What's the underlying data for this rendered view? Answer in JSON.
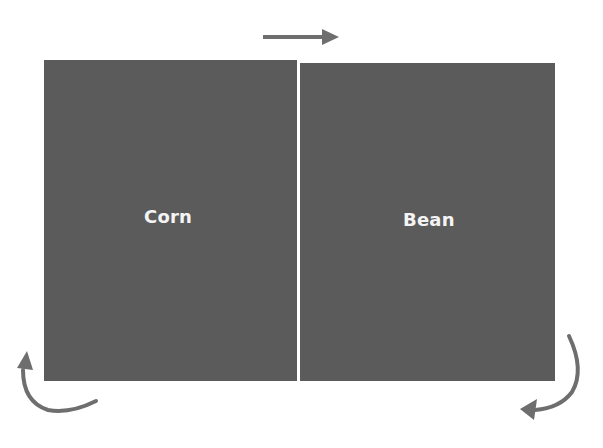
{
  "diagram": {
    "type": "crop-rotation",
    "fields": [
      {
        "id": "corn",
        "label": "Corn"
      },
      {
        "id": "bean",
        "label": "Bean"
      }
    ],
    "arrows": [
      {
        "id": "top",
        "direction": "right",
        "shape": "straight"
      },
      {
        "id": "bottom-right",
        "direction": "down-then-left",
        "shape": "curved"
      },
      {
        "id": "bottom-left",
        "direction": "left-then-up",
        "shape": "curved"
      }
    ],
    "colors": {
      "field_fill": "#5b5b5b",
      "arrow_color": "#6e6e6e",
      "label_color": "#f4f4f4",
      "divider_color": "#ffffff"
    }
  }
}
